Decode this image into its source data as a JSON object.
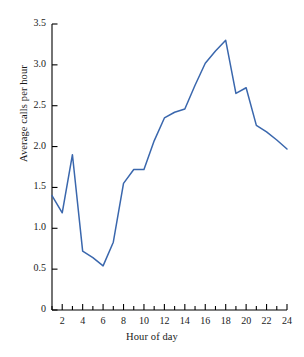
{
  "chart_data": {
    "type": "line",
    "title": "",
    "xlabel": "Hour of day",
    "ylabel": "Average calls per hour",
    "x": [
      1,
      2,
      3,
      4,
      5,
      6,
      7,
      8,
      9,
      10,
      11,
      12,
      13,
      14,
      15,
      16,
      17,
      18,
      19,
      20,
      21,
      22,
      23,
      24
    ],
    "values": [
      1.4,
      1.19,
      1.9,
      0.72,
      0.64,
      0.54,
      0.83,
      1.55,
      1.72,
      1.72,
      2.07,
      2.35,
      2.42,
      2.46,
      2.75,
      3.02,
      3.17,
      3.3,
      2.65,
      2.72,
      2.26,
      2.18,
      2.08,
      1.97
    ],
    "series": [
      {
        "name": "Average calls per hour",
        "values": [
          1.4,
          1.19,
          1.9,
          0.72,
          0.64,
          0.54,
          0.83,
          1.55,
          1.72,
          1.72,
          2.07,
          2.35,
          2.42,
          2.46,
          2.75,
          3.02,
          3.17,
          3.3,
          2.65,
          2.72,
          2.26,
          2.18,
          2.08,
          1.97
        ],
        "color": "#3a67ad"
      }
    ],
    "xlim": [
      1,
      24
    ],
    "ylim": [
      0,
      3.5
    ],
    "xticks": [
      1,
      2,
      3,
      4,
      5,
      6,
      7,
      8,
      9,
      10,
      11,
      12,
      13,
      14,
      15,
      16,
      17,
      18,
      19,
      20,
      21,
      22,
      23,
      24
    ],
    "xtick_labels": [
      "",
      "2",
      "",
      "4",
      "",
      "6",
      "",
      "8",
      "",
      "10",
      "",
      "12",
      "",
      "14",
      "",
      "16",
      "",
      "18",
      "",
      "20",
      "",
      "22",
      "",
      "24"
    ],
    "yticks": [
      0,
      0.5,
      1.0,
      1.5,
      2.0,
      2.5,
      3.0,
      3.5
    ],
    "ytick_labels": [
      "0",
      "0.5",
      "1.0",
      "1.5",
      "2.0",
      "2.5",
      "3.0",
      "3.5"
    ],
    "grid": false,
    "legend": false,
    "legend_position": "none",
    "axis_color": "#000000",
    "tick_direction": "in",
    "background": "#ffffff"
  }
}
